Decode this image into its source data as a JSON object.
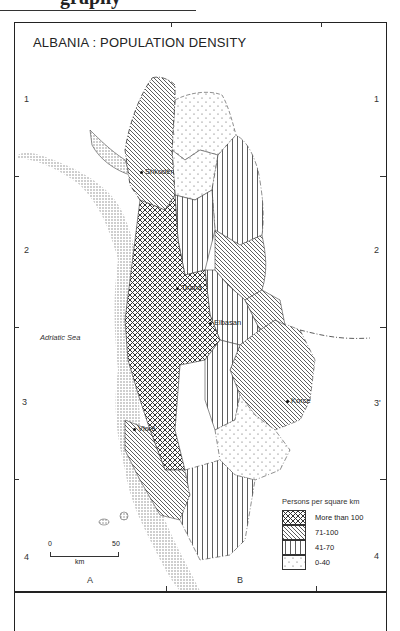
{
  "page": {
    "header_fragment": "graphy"
  },
  "map": {
    "title": "ALBANIA : POPULATION DENSITY",
    "sea_label": "Adriatic Sea",
    "grid": {
      "rows_left": [
        "1",
        "2",
        "3",
        "4"
      ],
      "rows_right": [
        "1",
        "2",
        "3'",
        "4"
      ],
      "columns": [
        "A",
        "B"
      ]
    },
    "cities": [
      {
        "name": "Shkodër"
      },
      {
        "name": "Tirana"
      },
      {
        "name": "Elbasan"
      },
      {
        "name": "Korce"
      },
      {
        "name": "Vlorë"
      }
    ],
    "scale": {
      "start": "0",
      "end": "50",
      "unit": "km"
    },
    "legend": {
      "title": "Persons per square km",
      "items": [
        {
          "label": "More than 100",
          "pattern": "crosshatch"
        },
        {
          "label": "71-100",
          "pattern": "diagonal"
        },
        {
          "label": "41-70",
          "pattern": "vertical"
        },
        {
          "label": "0-40",
          "pattern": "dots"
        }
      ]
    }
  }
}
